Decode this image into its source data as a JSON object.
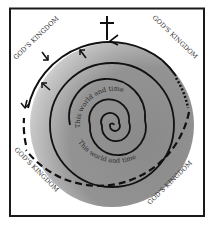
{
  "diagram": {
    "corner_labels": {
      "top_left": "GOD'S KINGDOM",
      "top_right": "GOD'S KINGDOM",
      "bottom_left": "GOD'S KINGDOM",
      "bottom_right": "GOD'S KINGDOM"
    },
    "inner_labels": {
      "upper": "This world and time",
      "lower": "This world and time"
    },
    "symbols": {
      "top": "cross-icon",
      "arrows": "inward-arrow-icon",
      "center": "spiral"
    },
    "colors": {
      "frame": "#1a1a1a",
      "disc_dark": "#8c8c8c",
      "disc_light": "#ffffff",
      "lines": "#111111",
      "text": "#333333"
    }
  }
}
